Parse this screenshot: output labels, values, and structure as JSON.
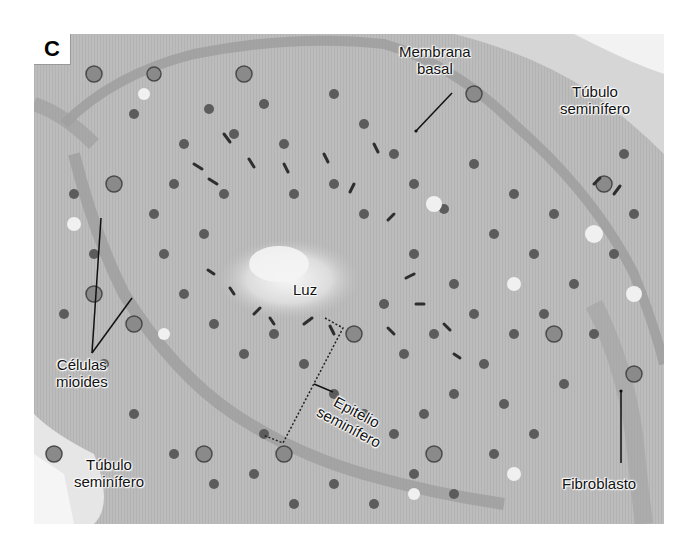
{
  "figure": {
    "panel_letter": "C",
    "labels": {
      "membrana_basal": {
        "line1": "Membrana",
        "line2": "basal"
      },
      "tubulo_top_right": {
        "line1": "Túbulo",
        "line2": "seminífero"
      },
      "luz": {
        "line1": "Luz"
      },
      "celulas_mioides": {
        "line1": "Células",
        "line2": "mioides"
      },
      "epitelio_seminifero": {
        "line1": "Epitelio",
        "line2": "seminífero"
      },
      "tubulo_bottom_left": {
        "line1": "Túbulo",
        "line2": "seminífero"
      },
      "fibroblasto": {
        "line1": "Fibroblasto"
      }
    },
    "colors": {
      "background_tissue": "#b9b9b9",
      "lumen": "#ebebeb",
      "nucleus": "#5a5a5a",
      "basal_membrane": "#9a9a9a",
      "label_text": "#111111"
    }
  }
}
